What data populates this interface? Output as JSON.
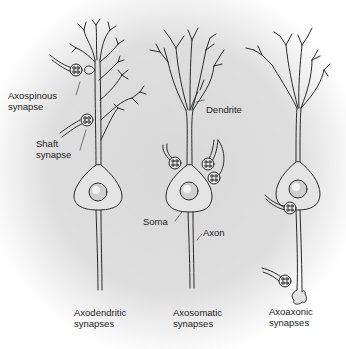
{
  "diagram": {
    "type": "neuron-synapse-types",
    "colors": {
      "background_center": "#dcdcdc",
      "background_edge": "#ffffff",
      "cell_fill": "#e4e4e4",
      "outline": "#2a2a2a",
      "nucleus": "#cfcfcf",
      "text": "#1e1e1e"
    },
    "labels": {
      "axospinous": {
        "line1": "Axospinous",
        "line2": "synapse"
      },
      "shaft": {
        "line1": "Shaft",
        "line2": "synapse"
      },
      "dendrite": "Dendrite",
      "soma": "Soma",
      "axon": "Axon"
    },
    "panels": [
      {
        "id": "axodendritic",
        "caption_line1": "Axodendritic",
        "caption_line2": "synapses"
      },
      {
        "id": "axosomatic",
        "caption_line1": "Axosomatic",
        "caption_line2": "synapses"
      },
      {
        "id": "axoaxonic",
        "caption_line1": "Axoaxonic",
        "caption_line2": "synapses"
      }
    ]
  }
}
